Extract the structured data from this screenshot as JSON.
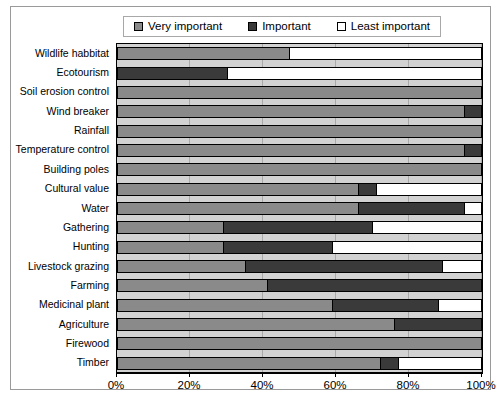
{
  "chart_data": {
    "type": "bar",
    "orientation": "horizontal",
    "stacked": true,
    "stack_mode": "percent",
    "title": "",
    "xlabel": "",
    "ylabel": "",
    "xlim": [
      0,
      100
    ],
    "xticks": [
      "0%",
      "20%",
      "40%",
      "60%",
      "80%",
      "100%"
    ],
    "xtick_values": [
      0,
      20,
      40,
      60,
      80,
      100
    ],
    "grid": true,
    "legend_position": "top",
    "plot_background": "#d2d2d2",
    "categories": [
      "Wildlife habbitat",
      "Ecotourism",
      "Soil erosion control",
      "Wind breaker",
      "Rainfall",
      "Temperature control",
      "Building poles",
      "Cultural value",
      "Water",
      "Gathering",
      "Hunting",
      "Livestock grazing",
      "Farming",
      "Medicinal plant",
      "Agriculture",
      "Firewood",
      "Timber"
    ],
    "series": [
      {
        "name": "Very important",
        "color": "#8a8a8a",
        "values": [
          47,
          0,
          100,
          95,
          100,
          95,
          100,
          66,
          66,
          29,
          29,
          35,
          41,
          59,
          76,
          100,
          72
        ]
      },
      {
        "name": "Important",
        "color": "#3a3a3a",
        "values": [
          0,
          30,
          0,
          5,
          0,
          5,
          0,
          5,
          29,
          41,
          30,
          54,
          59,
          29,
          24,
          0,
          5
        ]
      },
      {
        "name": "Least important",
        "color": "#ffffff",
        "values": [
          53,
          70,
          0,
          0,
          0,
          0,
          0,
          29,
          5,
          30,
          41,
          11,
          0,
          12,
          0,
          0,
          23
        ]
      }
    ]
  },
  "legend": {
    "items": [
      {
        "label": "Very important",
        "color": "#8a8a8a"
      },
      {
        "label": "Important",
        "color": "#3a3a3a"
      },
      {
        "label": "Least important",
        "color": "#ffffff"
      }
    ]
  }
}
